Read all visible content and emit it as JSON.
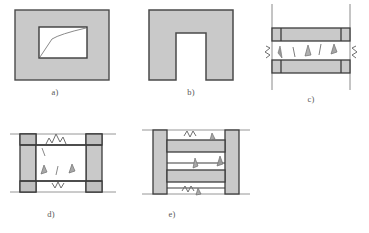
{
  "figure": {
    "kind": "technical-line-diagram",
    "background_color": "#ffffff",
    "colors": {
      "masonry_fill": "#c9c9c9",
      "masonry_fill_light": "#d2d2d2",
      "outline": "#4a4a4a",
      "outline_dark": "#3c3c3c",
      "thin_line": "#7a7a7a",
      "crack_line": "#6e6e6e",
      "crack_fill": "#9a9a9a",
      "label_text": "#555555",
      "panel_white": "#ffffff"
    }
  },
  "panels": [
    {
      "id": "a",
      "label": "a)",
      "title": "Solid masonry wall with opening and diagonal crack",
      "shape": "rectangular-wall-with-rectangular-opening",
      "features": [
        "outer gray masonry rectangle",
        "inner white rectangular opening",
        "diagonal crack across opening"
      ]
    },
    {
      "id": "b",
      "label": "b)",
      "title": "Masonry wall with door opening (inverted U)",
      "shape": "inverted-u-portal",
      "features": [
        "gray masonry",
        "full height central opening",
        "no cracks"
      ]
    },
    {
      "id": "c",
      "label": "c)",
      "title": "Infill panel between upper and lower beams with distributed cracking",
      "shape": "horizontal-beam-band-infill",
      "features": [
        "two horizontal gray beam bands",
        "vertical column lines extending beyond",
        "zigzag break symbols at left and right",
        "distributed crack marks in central infill"
      ]
    },
    {
      "id": "d",
      "label": "d)",
      "title": "Framed infill panel with corner and field cracking",
      "shape": "framed-infill-panel",
      "features": [
        "gray columns left and right",
        "gray beam stubs top and bottom corners",
        "white central infill",
        "zigzag cracks at top and bottom beams",
        "field crack marks"
      ]
    },
    {
      "id": "e",
      "label": "e)",
      "title": "Two-storey frame with horizontal beam bands and cracking",
      "shape": "multi-storey-frame",
      "features": [
        "gray columns left and right",
        "two horizontal gray beam bands",
        "zigzag cracks top and bottom",
        "crack marks at beam ends and mid-span"
      ]
    }
  ]
}
